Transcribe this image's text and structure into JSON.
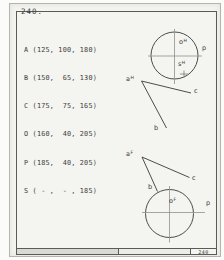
{
  "page": {
    "problem_number": "240.",
    "sheet_number": "240"
  },
  "coordinates": {
    "rows": [
      "A (125, 100, 180)",
      "B (150,  65, 130)",
      "C (175,  75, 165)",
      "O (160,  40, 205)",
      "P (185,  40, 205)",
      "S ( - ,  - , 185)"
    ]
  },
  "top_view": {
    "o": {
      "base": "o",
      "sup": "H"
    },
    "s": {
      "base": "s",
      "sup": "H"
    },
    "a": {
      "base": "a",
      "sup": "H"
    },
    "p": "p",
    "b": "b",
    "c": "c"
  },
  "front_view": {
    "a": {
      "base": "a",
      "sup": "F"
    },
    "o": {
      "base": "o",
      "sup": "F"
    },
    "p": "p",
    "b": "b",
    "c": "c"
  },
  "colors": {
    "paper": "#f4f4f0",
    "line": "#4c4c4a",
    "centerline": "#8f8f8c",
    "text": "#3c3c3a"
  }
}
